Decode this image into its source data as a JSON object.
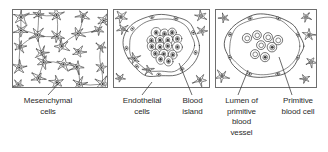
{
  "figure": {
    "width": 328,
    "height": 152,
    "background_color": "#ffffff",
    "ink_color": "#2b2b2b",
    "frame_color": "#6e6e6e",
    "nucleus_color": "#3a3a3a"
  },
  "panels": [
    {
      "id": "panel-1",
      "name": "mesenchymal-cells-panel",
      "x": 12,
      "y": 9,
      "width": 96,
      "height": 79,
      "content_description": "Loose network of star-shaped mesenchymal cells with dark nuclei"
    },
    {
      "id": "panel-2",
      "name": "blood-island-panel",
      "x": 113,
      "y": 9,
      "width": 97,
      "height": 79,
      "content_description": "Central blood island of packed polygonal cells ringed by flattened endothelial cells"
    },
    {
      "id": "panel-3",
      "name": "primitive-vessel-panel",
      "x": 215,
      "y": 9,
      "width": 102,
      "height": 79,
      "content_description": "Endothelial-lined lumen containing free rounded primitive blood cells"
    }
  ],
  "captions": [
    {
      "id": "caption-mesenchymal-cells",
      "name": "label-mesenchymal-cells",
      "text": "Mesenchymal\ncells",
      "lines": [
        "Mesenchymal",
        "cells"
      ],
      "x": 9,
      "y": 96,
      "width": 78
    },
    {
      "id": "caption-endothelial-cells",
      "name": "label-endothelial-cells",
      "text": "Endothelial\ncells",
      "lines": [
        "Endothelial",
        "cells"
      ],
      "x": 111,
      "y": 96,
      "width": 62
    },
    {
      "id": "caption-blood-island",
      "name": "label-blood-island",
      "text": "Blood\nisland",
      "lines": [
        "Blood",
        "island"
      ],
      "x": 174,
      "y": 96,
      "width": 37
    },
    {
      "id": "caption-lumen",
      "name": "label-lumen-of-primitive-blood-vessel",
      "text": "Lumen of\nprimitive\nblood\nvessel",
      "lines": [
        "Lumen of",
        "primitive",
        "blood",
        "vessel"
      ],
      "x": 214,
      "y": 96,
      "width": 55
    },
    {
      "id": "caption-primitive-blood-cell",
      "name": "label-primitive-blood-cell",
      "text": "Primitive\nblood cell",
      "lines": [
        "Primitive",
        "blood cell"
      ],
      "x": 271,
      "y": 96,
      "width": 54
    }
  ],
  "leaders": [
    {
      "name": "leader-mesenchymal-cells",
      "from": [
        60,
        82
      ],
      "to": [
        48,
        95
      ]
    },
    {
      "name": "leader-endothelial-cells",
      "from": [
        152,
        82
      ],
      "to": [
        142,
        95
      ]
    },
    {
      "name": "leader-blood-island",
      "from": [
        179,
        63
      ],
      "to": [
        192,
        95
      ]
    },
    {
      "name": "leader-lumen",
      "from": [
        248,
        70
      ],
      "to": [
        238,
        95
      ]
    },
    {
      "name": "leader-primitive-blood-cell",
      "from": [
        279,
        57
      ],
      "to": [
        292,
        95
      ]
    }
  ]
}
